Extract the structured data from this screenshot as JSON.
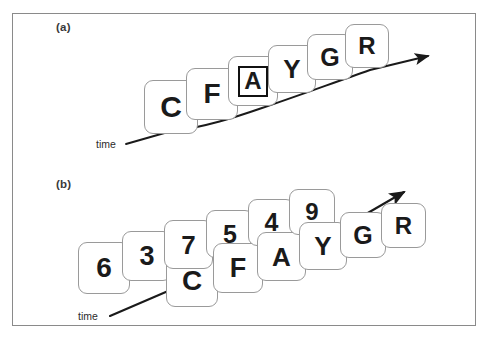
{
  "figure": {
    "width": 488,
    "height": 343,
    "background": "#ffffff",
    "frame_color": "#8a8a8a",
    "card_fill": "#ffffff",
    "card_border": "#9a9a9a",
    "glyph_color": "#1a1a1a",
    "arrow_color": "#1a1a1a"
  },
  "panels": [
    {
      "id": "a",
      "label": "(a)",
      "time_axis_label": "time",
      "description": "single stream of letters receding into depth along a time arrow",
      "cards": [
        {
          "text": "C",
          "kind": "letter",
          "row": "front",
          "highlighted": false,
          "left": 144,
          "top": 80,
          "size": 54,
          "font_size": 30
        },
        {
          "text": "F",
          "kind": "letter",
          "row": "front",
          "highlighted": false,
          "left": 186,
          "top": 68,
          "size": 52,
          "font_size": 28
        },
        {
          "text": "A",
          "kind": "letter",
          "row": "front",
          "highlighted": true,
          "left": 228,
          "top": 56,
          "size": 50,
          "font_size": 24
        },
        {
          "text": "Y",
          "kind": "letter",
          "row": "front",
          "highlighted": false,
          "left": 268,
          "top": 45,
          "size": 48,
          "font_size": 26
        },
        {
          "text": "G",
          "kind": "letter",
          "row": "front",
          "highlighted": false,
          "left": 307,
          "top": 34,
          "size": 46,
          "font_size": 25
        },
        {
          "text": "R",
          "kind": "letter",
          "row": "front",
          "highlighted": false,
          "left": 345,
          "top": 24,
          "size": 44,
          "font_size": 24
        }
      ]
    },
    {
      "id": "b",
      "label": "(b)",
      "time_axis_label": "time",
      "description": "two interleaved streams, digits in the back row and letters in the front row, receding along a time arrow",
      "cards": [
        {
          "text": "6",
          "kind": "digit",
          "row": "back",
          "highlighted": false,
          "left": 78,
          "top": 242,
          "size": 52,
          "font_size": 28
        },
        {
          "text": "3",
          "kind": "digit",
          "row": "back",
          "highlighted": false,
          "left": 122,
          "top": 231,
          "size": 50,
          "font_size": 27
        },
        {
          "text": "C",
          "kind": "letter",
          "row": "front",
          "highlighted": false,
          "left": 166,
          "top": 255,
          "size": 52,
          "font_size": 28
        },
        {
          "text": "7",
          "kind": "digit",
          "row": "back",
          "highlighted": false,
          "left": 164,
          "top": 220,
          "size": 49,
          "font_size": 26
        },
        {
          "text": "5",
          "kind": "digit",
          "row": "back",
          "highlighted": false,
          "left": 206,
          "top": 210,
          "size": 48,
          "font_size": 25
        },
        {
          "text": "F",
          "kind": "letter",
          "row": "front",
          "highlighted": false,
          "left": 213,
          "top": 243,
          "size": 50,
          "font_size": 27
        },
        {
          "text": "4",
          "kind": "digit",
          "row": "back",
          "highlighted": false,
          "left": 248,
          "top": 199,
          "size": 47,
          "font_size": 25
        },
        {
          "text": "A",
          "kind": "letter",
          "row": "front",
          "highlighted": false,
          "left": 257,
          "top": 232,
          "size": 49,
          "font_size": 26
        },
        {
          "text": "9",
          "kind": "digit",
          "row": "back",
          "highlighted": false,
          "left": 289,
          "top": 189,
          "size": 46,
          "font_size": 24
        },
        {
          "text": "Y",
          "kind": "letter",
          "row": "front",
          "highlighted": false,
          "left": 299,
          "top": 222,
          "size": 48,
          "font_size": 26
        },
        {
          "text": "G",
          "kind": "letter",
          "row": "front",
          "highlighted": false,
          "left": 340,
          "top": 212,
          "size": 46,
          "font_size": 25
        },
        {
          "text": "R",
          "kind": "letter",
          "row": "front",
          "highlighted": false,
          "left": 381,
          "top": 203,
          "size": 45,
          "font_size": 24
        }
      ]
    }
  ],
  "chart_data": {
    "type": "diagram",
    "panel_a": {
      "label": "(a)",
      "stream": [
        "C",
        "F",
        "A",
        "Y",
        "G",
        "R"
      ],
      "target": "A",
      "target_marker": "box outline",
      "axis_label": "time",
      "streams": 1
    },
    "panel_b": {
      "label": "(b)",
      "streams": 2,
      "digit_stream": [
        "6",
        "3",
        "7",
        "5",
        "4",
        "9"
      ],
      "letter_stream": [
        "C",
        "F",
        "A",
        "Y",
        "G",
        "R"
      ],
      "axis_label": "time"
    }
  }
}
